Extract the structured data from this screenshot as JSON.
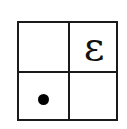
{
  "diagram": {
    "type": "2x2 grid",
    "cells": [
      {
        "position": "top-left",
        "content": ""
      },
      {
        "position": "top-right",
        "content": "ε"
      },
      {
        "position": "bottom-left",
        "content": "dot"
      },
      {
        "position": "bottom-right",
        "content": ""
      }
    ],
    "symbol": "ε",
    "colors": {
      "line": "#1a1a1a",
      "dot": "#000000",
      "background": "#ffffff"
    }
  }
}
